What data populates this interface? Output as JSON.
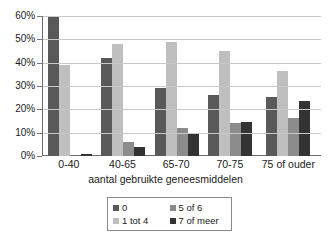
{
  "chart_data": {
    "type": "bar",
    "title": "",
    "xlabel": "aantal gebruikte geneesmiddelen",
    "ylabel": "",
    "categories": [
      "0-40",
      "40-65",
      "65-70",
      "70-75",
      "75 of ouder"
    ],
    "ylim": [
      0,
      60
    ],
    "ytick_labels": [
      "0%",
      "10%",
      "20%",
      "30%",
      "40%",
      "50%",
      "60%"
    ],
    "ytick_values": [
      0,
      10,
      20,
      30,
      40,
      50,
      60
    ],
    "grid": true,
    "legend_position": "bottom",
    "series": [
      {
        "name": "0",
        "color": "#595959",
        "values": [
          60,
          42,
          29,
          26,
          25.5
        ]
      },
      {
        "name": "1 tot 4",
        "color": "#bfbfbf",
        "values": [
          39,
          48,
          49,
          45,
          36.5
        ]
      },
      {
        "name": "5 of 6",
        "color": "#8c8c8c",
        "values": [
          0,
          6,
          12,
          14,
          16.5
        ]
      },
      {
        "name": "7 of meer",
        "color": "#333333",
        "values": [
          1,
          4,
          10,
          14.5,
          23.5
        ]
      }
    ]
  },
  "legend": {
    "entries": [
      {
        "label": "0",
        "color": "#595959"
      },
      {
        "label": "5 of 6",
        "color": "#8c8c8c"
      },
      {
        "label": "1 tot 4",
        "color": "#bfbfbf"
      },
      {
        "label": "7 of meer",
        "color": "#333333"
      }
    ]
  }
}
